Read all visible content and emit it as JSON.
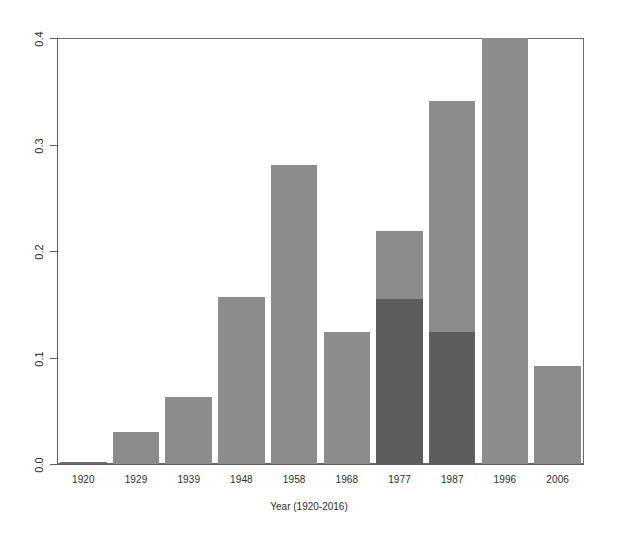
{
  "chart_data": {
    "type": "bar",
    "title": "",
    "xlabel": "Year (1920-2016)",
    "ylabel": "",
    "categories": [
      "1920",
      "1929",
      "1939",
      "1948",
      "1958",
      "1968",
      "1977",
      "1987",
      "1996",
      "2006"
    ],
    "ylim": [
      0.0,
      0.4
    ],
    "yticks": [
      "0.0",
      "0.1",
      "0.2",
      "0.3",
      "0.4"
    ],
    "ytick_values": [
      0.0,
      0.1,
      0.2,
      0.3,
      0.4
    ],
    "grid": false,
    "legend": "none",
    "series": [
      {
        "name": "back-series",
        "color": "#8c8c8c",
        "values": [
          0.001,
          0.03,
          0.063,
          0.157,
          0.281,
          0.124,
          0.219,
          0.341,
          0.402,
          0.092
        ]
      },
      {
        "name": "front-series",
        "color": "#5d5d5d",
        "values": [
          0.0,
          0.0,
          0.0,
          0.0,
          0.0,
          0.0,
          0.155,
          0.124,
          0.0,
          0.0
        ]
      }
    ]
  },
  "axes": {
    "y_tick_labels": [
      "0.0",
      "0.1",
      "0.2",
      "0.3",
      "0.4"
    ],
    "x_tick_labels": [
      "1920",
      "1929",
      "1939",
      "1948",
      "1958",
      "1968",
      "1977",
      "1987",
      "1996",
      "2006"
    ],
    "x_axis_title": "Year (1920-2016)"
  },
  "colors": {
    "bar_light": "#8c8c8c",
    "bar_dark": "#5d5d5d",
    "frame": "#6b6b6b",
    "text": "#2b2b2b",
    "background": "#ffffff"
  }
}
